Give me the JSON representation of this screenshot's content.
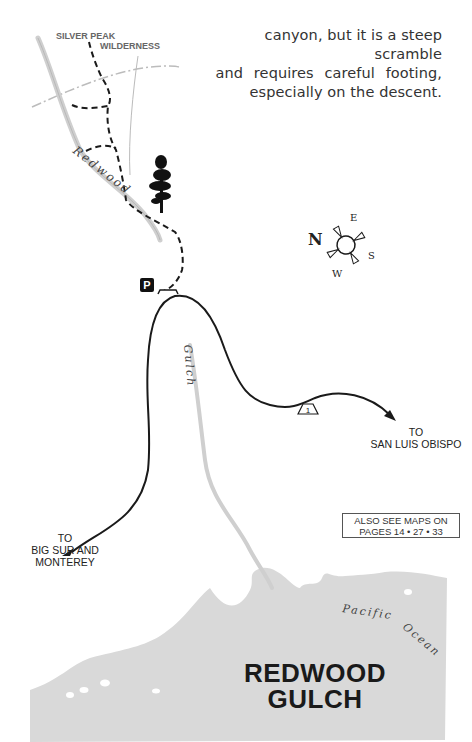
{
  "intro_text": {
    "line1": "canyon, but it is a steep scramble",
    "line2": "and requires careful footing,",
    "line3": "especially on the descent."
  },
  "map": {
    "wilderness_label": {
      "line1": "SILVER PEAK",
      "line2": "WILDERNESS"
    },
    "creek_labels": {
      "redwood": "Redwood",
      "gulch": "Gulch"
    },
    "parking_icon": "P",
    "highway_shield": "1",
    "destinations": {
      "east": {
        "line1": "TO",
        "line2": "SAN LUIS OBISPO"
      },
      "west": {
        "line1": "TO",
        "line2": "BIG SUR AND",
        "line3": "MONTEREY"
      }
    },
    "compass": {
      "n": "N",
      "e": "E",
      "s": "S",
      "w": "W"
    },
    "see_also": {
      "line1": "ALSO SEE MAPS ON",
      "line2": "PAGES 14 • 27 • 33"
    },
    "ocean_label": "Pacific Ocean",
    "title": {
      "line1": "REDWOOD",
      "line2": "GULCH"
    },
    "colors": {
      "ocean": "#d9d9d9",
      "creek": "#cfcfcf",
      "road": "#1a1a1a",
      "trail": "#1a1a1a",
      "boundary": "#bdbdbd"
    },
    "icons": [
      "tree-icon",
      "parking-icon",
      "compass-icon",
      "highway-1-shield-icon",
      "arrow-icon"
    ]
  }
}
